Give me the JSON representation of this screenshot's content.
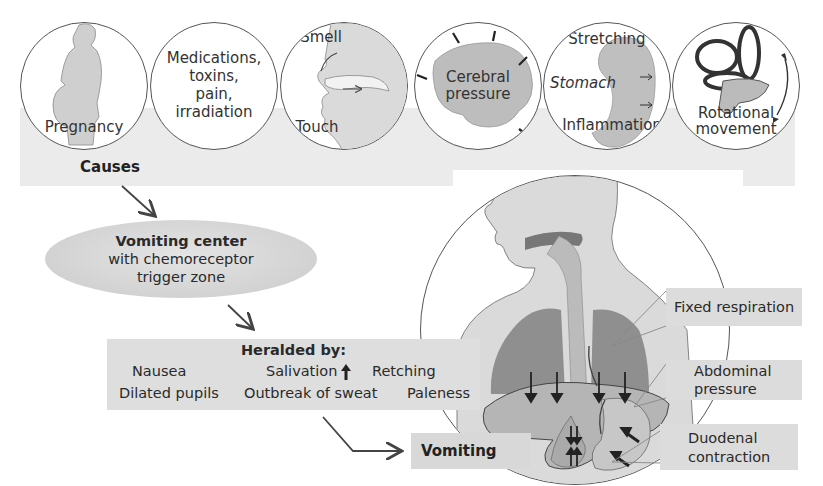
{
  "diagram": {
    "causes": {
      "title": "Causes",
      "items": [
        {
          "label": "Pregnancy",
          "icon": "pregnant-woman-icon"
        },
        {
          "label_lines": [
            "Medications,",
            "toxins,",
            "pain,",
            "irradiation"
          ]
        },
        {
          "labels": [
            "Smell",
            "Touch"
          ],
          "icon": "head-profile-icon"
        },
        {
          "label_lines": [
            "Cerebral",
            "pressure"
          ],
          "icon": "brain-icon"
        },
        {
          "labels": [
            "Stretching",
            "Stomach",
            "Inflammation"
          ],
          "icon": "stomach-icon"
        },
        {
          "label_lines": [
            "Rotational",
            "movement"
          ],
          "icon": "inner-ear-icon"
        }
      ]
    },
    "center": {
      "title": "Vomiting center",
      "line2": "with chemoreceptor",
      "line3": "trigger zone"
    },
    "heralded": {
      "title": "Heralded by:",
      "row1": [
        "Nausea",
        "Salivation",
        "Retching"
      ],
      "salivation_indicator": "up-arrow-icon",
      "row2": [
        "Dilated pupils",
        "Outbreak of sweat",
        "Paleness"
      ]
    },
    "result": {
      "label": "Vomiting"
    },
    "mechanisms": [
      {
        "label": "Fixed respiration"
      },
      {
        "label_lines": [
          "Abdominal",
          "pressure"
        ]
      },
      {
        "label_lines": [
          "Duodenal",
          "contraction"
        ]
      }
    ],
    "colors": {
      "band": "#ebebeb",
      "ellipse": "#d2d2d2",
      "box": "#dcdcdc",
      "stroke": "#555555",
      "text": "#2a2a2a",
      "organ": "#b5b5b5",
      "lung": "#8f8f8f"
    }
  }
}
